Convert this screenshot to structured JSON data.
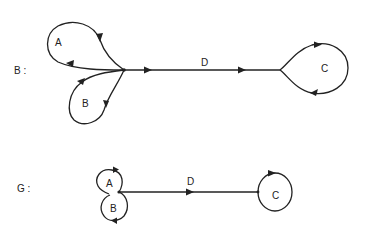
{
  "graphs": [
    {
      "name": "B",
      "label": "B :",
      "loops": [
        {
          "name": "A",
          "label": "A"
        },
        {
          "name": "B",
          "label": "B"
        },
        {
          "name": "C",
          "label": "C"
        }
      ],
      "edges": [
        {
          "name": "D",
          "label": "D"
        }
      ]
    },
    {
      "name": "G",
      "label": "G :",
      "loops": [
        {
          "name": "A",
          "label": "A"
        },
        {
          "name": "B",
          "label": "B"
        },
        {
          "name": "C",
          "label": "C"
        }
      ],
      "edges": [
        {
          "name": "D",
          "label": "D"
        }
      ]
    }
  ],
  "colors": {
    "stroke": "#222222",
    "background": "#ffffff"
  }
}
